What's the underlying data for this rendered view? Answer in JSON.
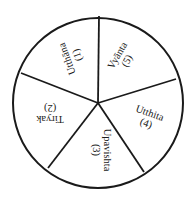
{
  "diagram": {
    "type": "wheel",
    "center": {
      "x": 98,
      "y": 103
    },
    "radius": 85,
    "stroke_color": "#1a1a1a",
    "background": "#ffffff",
    "spokes": [
      {
        "x": 99,
        "y": 16
      },
      {
        "x": 176,
        "y": 79
      },
      {
        "x": 144,
        "y": 172
      },
      {
        "x": 48,
        "y": 168
      },
      {
        "x": 21,
        "y": 73
      }
    ],
    "segments": [
      {
        "name": "Utthāna",
        "number": "(1)",
        "position": "top-left",
        "rotation": -110,
        "x": 72,
        "y": 57
      },
      {
        "name": "Tiryak",
        "number": "(2)",
        "position": "left",
        "rotation": 180,
        "x": 50,
        "y": 114
      },
      {
        "name": "Upavishta",
        "number": "(3)",
        "position": "bottom",
        "rotation": 90,
        "x": 102,
        "y": 150
      },
      {
        "name": "Utthita",
        "number": "(4)",
        "position": "right",
        "rotation": 20,
        "x": 148,
        "y": 118
      },
      {
        "name": "Vyānta",
        "number": "(5)",
        "position": "top-right",
        "rotation": -60,
        "x": 122,
        "y": 58
      }
    ]
  }
}
